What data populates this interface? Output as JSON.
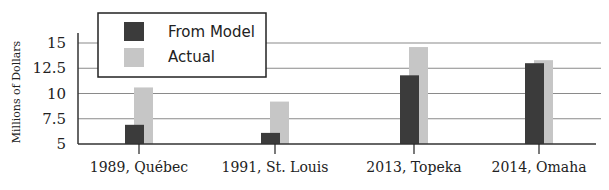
{
  "chart_data": {
    "type": "bar",
    "title": "",
    "xlabel": "",
    "ylabel": "Millions of Dollars",
    "categories": [
      "1989, Québec",
      "1991, St. Louis",
      "2013, Topeka",
      "2014, Omaha"
    ],
    "series": [
      {
        "name": "From Model",
        "color": "#3b3b3b",
        "values": [
          6.9,
          6.1,
          11.8,
          13.0
        ]
      },
      {
        "name": "Actual",
        "color": "#c6c6c6",
        "values": [
          10.6,
          9.2,
          14.6,
          13.3
        ]
      }
    ],
    "ylim": [
      5,
      15
    ],
    "yticks": [
      5,
      7.5,
      10,
      12.5,
      15
    ],
    "ytick_labels": [
      "5",
      "7.5",
      "10",
      "12.5",
      "15"
    ],
    "grid": true,
    "legend_position": "upper-left"
  },
  "legend": {
    "items": [
      {
        "label": "From Model",
        "color": "#3b3b3b"
      },
      {
        "label": "Actual",
        "color": "#c6c6c6"
      }
    ]
  }
}
